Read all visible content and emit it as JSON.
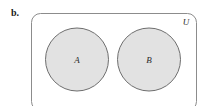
{
  "figure": {
    "part_label": "b.",
    "caption": "",
    "type": "venn-diagram-disjoint-sets"
  },
  "universe": {
    "label": "U",
    "label_x": 186,
    "label_y": 25,
    "rect": {
      "x": 31.5,
      "y": 13.5,
      "width": 165,
      "height": 97,
      "rx": 9,
      "stroke": "#8c8c8c",
      "fill": "#ffffff",
      "stroke_width": 1
    }
  },
  "sets": [
    {
      "label": "A",
      "cx": 77,
      "cy": 59.5,
      "r": 31.5,
      "label_x": 77,
      "label_y": 63,
      "fill": "#e2e2e2",
      "stroke": "#6e6e6e"
    },
    {
      "label": "B",
      "cx": 149,
      "cy": 59.5,
      "r": 31.5,
      "label_x": 149,
      "label_y": 63,
      "fill": "#e2e2e2",
      "stroke": "#6e6e6e"
    }
  ],
  "colors": {
    "page_background": "#ffffff",
    "circle_fill": "#e2e2e2",
    "circle_stroke": "#6e6e6e",
    "rect_stroke": "#8c8c8c",
    "text": "#2b2b2b",
    "label_text": "#1a1a1a"
  }
}
